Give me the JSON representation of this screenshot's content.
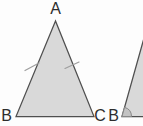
{
  "diagram": {
    "type": "geometry-triangles",
    "background": "#fdfdfd",
    "colors": {
      "fill": "#d9d9d9",
      "outline": "#4f4f4f",
      "tick": "#9e9e9e",
      "angle_fill": "#c3c3c3",
      "angle_outline": "#888888",
      "label": "#2d2d2d"
    },
    "main_triangle": {
      "label_apex": "A",
      "label_bottom_left": "B",
      "label_bottom_right": "C",
      "equal_side_ticks": 2
    },
    "partial_triangle": {
      "label_vertex": "B",
      "has_angle_mark": true
    }
  }
}
